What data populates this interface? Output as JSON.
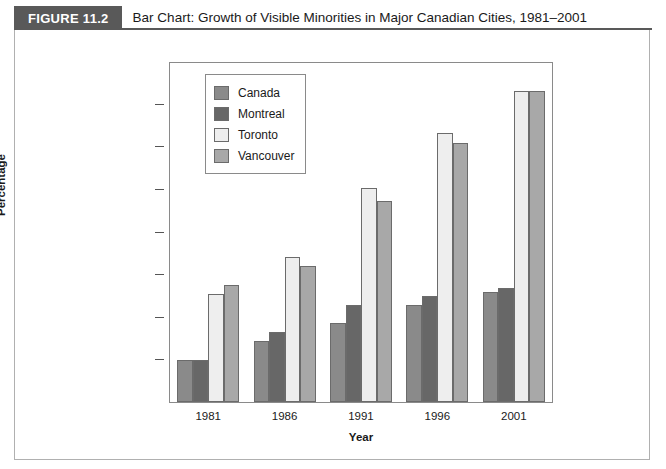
{
  "figure": {
    "number_label": "FIGURE 11.2",
    "title": "Bar Chart: Growth of Visible Minorities in Major Canadian Cities, 1981–2001"
  },
  "chart_data": {
    "type": "bar",
    "title": "Bar Chart: Growth of Visible Minorities in Major Canadian Cities, 1981–2001",
    "xlabel": "Year",
    "ylabel": "Percentage",
    "categories": [
      "1981",
      "1986",
      "1991",
      "1996",
      "2001"
    ],
    "series": [
      {
        "name": "Canada",
        "color": "#8a8a8a",
        "values": [
          4.9,
          7.2,
          9.3,
          11.5,
          13.0
        ]
      },
      {
        "name": "Montreal",
        "color": "#676767",
        "values": [
          4.9,
          8.3,
          11.5,
          12.5,
          13.5
        ]
      },
      {
        "name": "Toronto",
        "color": "#eeeeee",
        "values": [
          12.8,
          17.1,
          25.3,
          31.7,
          36.7
        ]
      },
      {
        "name": "Vancouver",
        "color": "#a8a8a8",
        "values": [
          13.8,
          16.0,
          23.7,
          30.6,
          36.7
        ]
      }
    ],
    "ylim": [
      0,
      40
    ],
    "yticks": [
      0,
      5,
      10,
      15,
      20,
      25,
      30,
      35,
      40
    ],
    "ytick_labels": [
      "0",
      "5",
      "10",
      "15",
      "20",
      "25",
      "30",
      "35",
      "40"
    ],
    "grid": false,
    "legend_position": "upper-left-inside"
  },
  "colors": {
    "header_band": "#595959",
    "frame_border": "#8a8a8a",
    "body_border": "#b0b0b0",
    "text": "#1a1a1a"
  }
}
